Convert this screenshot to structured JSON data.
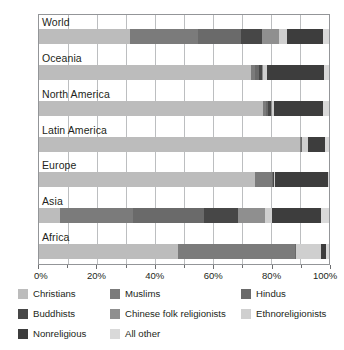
{
  "chart_data": {
    "type": "bar",
    "orientation": "horizontal",
    "stacked": true,
    "normalized_percent": true,
    "title": "",
    "subtitle": "",
    "xlabel": "",
    "ylabel": "",
    "xlim": [
      0,
      100
    ],
    "xticks": [
      0,
      20,
      40,
      60,
      80,
      100
    ],
    "xtick_labels": [
      "0%",
      "20%",
      "40%",
      "60%",
      "80%",
      "100%"
    ],
    "minor_xticks": [
      10,
      30,
      50,
      70,
      90
    ],
    "grid": true,
    "legend_position": "bottom",
    "categories": [
      "World",
      "Oceania",
      "North America",
      "Latin America",
      "Europe",
      "Asia",
      "Africa"
    ],
    "series": [
      {
        "name": "Christians",
        "color": "#bcbcbc",
        "values": [
          31.5,
          73.0,
          77.4,
          90.0,
          74.5,
          7.1,
          47.8
        ]
      },
      {
        "name": "Muslims",
        "color": "#7b7b7b",
        "values": [
          23.2,
          1.6,
          1.0,
          0.4,
          5.9,
          25.2,
          40.6
        ]
      },
      {
        "name": "Hindus",
        "color": "#6a6a6a",
        "values": [
          15.0,
          1.4,
          0.7,
          0.2,
          0.3,
          24.7,
          0.2
        ]
      },
      {
        "name": "Buddhists",
        "color": "#474747",
        "values": [
          7.1,
          0.9,
          1.0,
          0.1,
          0.4,
          11.5,
          0.1
        ]
      },
      {
        "name": "Chinese folk religionists",
        "color": "#8f8f8f",
        "values": [
          5.9,
          0.5,
          0.4,
          0.1,
          0.1,
          9.6,
          0.1
        ]
      },
      {
        "name": "Ethnoreligionists",
        "color": "#cfcfcf",
        "values": [
          3.0,
          1.3,
          0.4,
          1.8,
          0.2,
          2.2,
          8.6
        ]
      },
      {
        "name": "Nonreligious",
        "color": "#3d3d3d",
        "values": [
          12.2,
          19.5,
          17.1,
          6.0,
          18.1,
          17.1,
          1.6
        ]
      },
      {
        "name": "All other",
        "color": "#d9d9d9",
        "values": [
          2.1,
          1.8,
          2.0,
          1.4,
          0.5,
          2.6,
          1.0
        ]
      }
    ]
  },
  "legend": {
    "items": [
      {
        "label": "Christians",
        "color": "#bcbcbc"
      },
      {
        "label": "Muslims",
        "color": "#7b7b7b"
      },
      {
        "label": "Hindus",
        "color": "#6a6a6a"
      },
      {
        "label": "Buddhists",
        "color": "#474747"
      },
      {
        "label": "Chinese folk religionists",
        "color": "#8f8f8f"
      },
      {
        "label": "Ethnoreligionists",
        "color": "#cfcfcf"
      },
      {
        "label": "Nonreligious",
        "color": "#3d3d3d"
      },
      {
        "label": "All other",
        "color": "#d9d9d9"
      }
    ]
  },
  "axis": {
    "tick_labels": [
      "0%",
      "20%",
      "40%",
      "60%",
      "80%",
      "100%"
    ]
  },
  "row_labels": [
    "World",
    "Oceania",
    "North America",
    "Latin America",
    "Europe",
    "Asia",
    "Africa"
  ]
}
